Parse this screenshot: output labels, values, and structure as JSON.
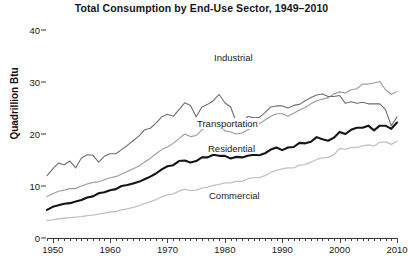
{
  "chart_data": {
    "type": "line",
    "title": "Total Consumption by End-Use Sector, 1949–2010",
    "xlabel": "",
    "ylabel": "Quadrillion Btu",
    "xlim": [
      1949,
      2010
    ],
    "ylim": [
      0,
      40
    ],
    "yticks": [
      0,
      10,
      20,
      30,
      40
    ],
    "ytick_labels": [
      "0",
      "10",
      "20",
      "30",
      "40"
    ],
    "xticks": [
      1950,
      1960,
      1970,
      1980,
      1990,
      2000,
      2010
    ],
    "xtick_labels": [
      "1950",
      "1960",
      "1970",
      "1980",
      "1990",
      "2000",
      "2010"
    ],
    "x_minor_tick_interval": 1,
    "grid": false,
    "legend_position": "inline-annotations",
    "x": [
      1949,
      1950,
      1951,
      1952,
      1953,
      1954,
      1955,
      1956,
      1957,
      1958,
      1959,
      1960,
      1961,
      1962,
      1963,
      1964,
      1965,
      1966,
      1967,
      1968,
      1969,
      1970,
      1971,
      1972,
      1973,
      1974,
      1975,
      1976,
      1977,
      1978,
      1979,
      1980,
      1981,
      1982,
      1983,
      1984,
      1985,
      1986,
      1987,
      1988,
      1989,
      1990,
      1991,
      1992,
      1993,
      1994,
      1995,
      1996,
      1997,
      1998,
      1999,
      2000,
      2001,
      2002,
      2003,
      2004,
      2005,
      2006,
      2007,
      2008,
      2009,
      2010
    ],
    "series": [
      {
        "name": "Industrial",
        "color": "#6e6e6e",
        "line_width": 1.1,
        "label_position": {
          "x": 213,
          "y": 52
        },
        "values": [
          12.0,
          13.3,
          14.4,
          14.1,
          14.8,
          13.5,
          15.4,
          16.0,
          15.9,
          14.6,
          15.7,
          16.2,
          16.2,
          17.0,
          17.8,
          18.7,
          19.6,
          20.8,
          21.1,
          22.1,
          23.3,
          23.8,
          23.4,
          24.7,
          26.0,
          25.5,
          23.3,
          25.2,
          25.7,
          26.4,
          27.6,
          26.0,
          25.2,
          22.3,
          22.0,
          23.4,
          23.1,
          23.2,
          24.1,
          25.2,
          25.4,
          25.4,
          25.0,
          25.5,
          25.7,
          26.4,
          27.0,
          27.5,
          27.7,
          27.2,
          27.2,
          27.4,
          25.9,
          26.2,
          25.9,
          26.1,
          25.8,
          25.8,
          25.8,
          24.7,
          21.6,
          23.3
        ]
      },
      {
        "name": "Transportation",
        "color": "#9a9a9a",
        "line_width": 1.1,
        "label_position": {
          "x": 196,
          "y": 118
        },
        "values": [
          8.0,
          8.5,
          9.0,
          9.2,
          9.5,
          9.5,
          10.0,
          10.4,
          10.7,
          10.8,
          11.2,
          11.6,
          11.8,
          12.3,
          12.8,
          13.3,
          13.8,
          14.6,
          15.3,
          16.2,
          17.0,
          17.5,
          18.2,
          19.1,
          20.0,
          19.5,
          19.7,
          20.8,
          21.5,
          22.2,
          21.9,
          20.6,
          20.4,
          20.0,
          20.2,
          20.8,
          21.4,
          22.0,
          22.7,
          23.4,
          23.9,
          23.9,
          23.4,
          24.0,
          24.6,
          25.1,
          25.8,
          26.4,
          26.7,
          27.0,
          27.7,
          28.1,
          27.9,
          28.5,
          28.7,
          29.6,
          29.6,
          29.8,
          30.1,
          28.5,
          27.6,
          28.2
        ]
      },
      {
        "name": "Residential",
        "color": "#151515",
        "line_width": 2.1,
        "label_position": {
          "x": 207,
          "y": 143
        },
        "values": [
          5.4,
          6.0,
          6.3,
          6.6,
          6.7,
          7.0,
          7.3,
          7.8,
          8.0,
          8.6,
          8.8,
          9.2,
          9.4,
          10.0,
          10.2,
          10.5,
          10.8,
          11.3,
          11.8,
          12.4,
          13.2,
          13.8,
          14.0,
          14.8,
          14.9,
          14.5,
          14.8,
          15.5,
          15.5,
          16.0,
          15.8,
          15.8,
          15.3,
          15.6,
          15.5,
          15.8,
          16.0,
          15.9,
          16.3,
          17.0,
          17.4,
          16.9,
          17.4,
          17.5,
          18.3,
          18.2,
          18.5,
          19.4,
          19.0,
          18.7,
          19.3,
          20.4,
          20.0,
          20.8,
          21.2,
          21.2,
          21.6,
          20.7,
          21.6,
          21.6,
          21.0,
          22.2
        ]
      },
      {
        "name": "Commercial",
        "color": "#c2c2c2",
        "line_width": 1.3,
        "label_position": {
          "x": 208,
          "y": 190
        },
        "values": [
          3.4,
          3.5,
          3.7,
          3.8,
          3.9,
          4.0,
          4.1,
          4.3,
          4.4,
          4.6,
          4.8,
          5.0,
          5.1,
          5.4,
          5.6,
          5.9,
          6.2,
          6.6,
          7.0,
          7.4,
          7.9,
          8.3,
          8.5,
          9.0,
          9.4,
          9.1,
          9.2,
          9.6,
          9.8,
          10.1,
          10.3,
          10.6,
          10.6,
          10.9,
          10.9,
          11.4,
          11.6,
          11.6,
          12.0,
          12.6,
          13.0,
          13.3,
          13.5,
          13.5,
          14.0,
          14.1,
          14.6,
          15.1,
          15.4,
          15.5,
          16.0,
          17.2,
          17.1,
          17.4,
          17.4,
          17.7,
          17.9,
          17.7,
          18.4,
          18.5,
          18.0,
          18.6
        ]
      }
    ]
  }
}
